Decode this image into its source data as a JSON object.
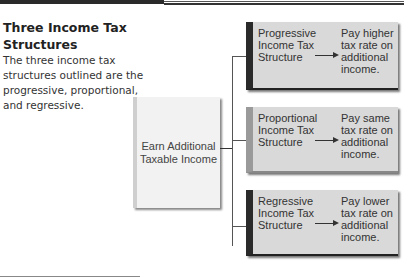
{
  "header": {
    "title": "Three Income Tax Structures",
    "description": "The three income tax structures outlined are the progressive, proportional, and regressive."
  },
  "diagram": {
    "source": {
      "label": "Earn Additional Taxable Income"
    },
    "branches": [
      {
        "name": "Progressive Income Tax Structure",
        "result": "Pay higher tax rate on additional income."
      },
      {
        "name": "Proportional Income Tax Structure",
        "result": "Pay same tax rate on additional income."
      },
      {
        "name": "Regressive Income Tax Structure",
        "result": "Pay lower tax rate on additional income."
      }
    ]
  },
  "colors": {
    "box_fill": "#d9d9d9",
    "box_accent_dark": "#2a2a2a",
    "box_accent_light": "#9a9a9a",
    "source_fill": "#f2f2f2"
  }
}
